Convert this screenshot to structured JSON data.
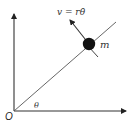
{
  "diagram": {
    "title": "",
    "origin_label": "O",
    "angle_label": "θ",
    "mass_label": "m",
    "velocity_label": "v = rθ̇",
    "colors": {
      "line": "#555555",
      "axis": "#333333",
      "mass": "#111111"
    }
  }
}
